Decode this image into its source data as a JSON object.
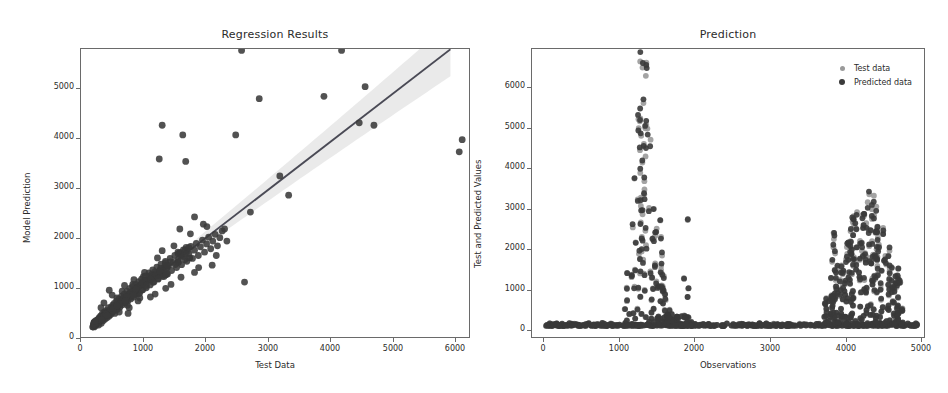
{
  "figure": {
    "width": 948,
    "height": 393,
    "background": "#ffffff"
  },
  "chart_data": [
    {
      "id": "regression-results",
      "type": "scatter",
      "title": "Regression Results",
      "xlabel": "Test Data",
      "ylabel": "Model Prediction",
      "xlim": [
        -180,
        6450
      ],
      "ylim": [
        -230,
        5780
      ],
      "xticks": [
        0,
        1000,
        2000,
        3000,
        4000,
        5000,
        6000
      ],
      "yticks": [
        0,
        1000,
        2000,
        3000,
        4000,
        5000
      ],
      "grid": false,
      "legend": null,
      "marker_color": "#3a3a3a",
      "line_color": "#4a4a55",
      "band_color": "#e3e3e3",
      "regression_line": {
        "slope": 0.94,
        "intercept": 40,
        "x_from": 0,
        "x_to": 6100
      },
      "confidence_band": {
        "half_width_at_x0": 45,
        "half_width_at_xmax": 560
      },
      "points": [
        [
          30,
          60
        ],
        [
          45,
          20
        ],
        [
          60,
          110
        ],
        [
          70,
          50
        ],
        [
          85,
          140
        ],
        [
          95,
          90
        ],
        [
          110,
          175
        ],
        [
          120,
          60
        ],
        [
          130,
          210
        ],
        [
          145,
          130
        ],
        [
          155,
          250
        ],
        [
          165,
          95
        ],
        [
          175,
          200
        ],
        [
          185,
          300
        ],
        [
          195,
          150
        ],
        [
          205,
          260
        ],
        [
          215,
          330
        ],
        [
          225,
          180
        ],
        [
          240,
          290
        ],
        [
          250,
          360
        ],
        [
          260,
          210
        ],
        [
          275,
          330
        ],
        [
          285,
          420
        ],
        [
          295,
          240
        ],
        [
          310,
          350
        ],
        [
          320,
          275
        ],
        [
          335,
          430
        ],
        [
          345,
          310
        ],
        [
          360,
          470
        ],
        [
          370,
          340
        ],
        [
          385,
          510
        ],
        [
          395,
          300
        ],
        [
          410,
          440
        ],
        [
          425,
          560
        ],
        [
          435,
          380
        ],
        [
          450,
          520
        ],
        [
          465,
          600
        ],
        [
          480,
          430
        ],
        [
          495,
          560
        ],
        [
          510,
          660
        ],
        [
          525,
          480
        ],
        [
          540,
          620
        ],
        [
          555,
          700
        ],
        [
          570,
          520
        ],
        [
          585,
          640
        ],
        [
          600,
          760
        ],
        [
          615,
          560
        ],
        [
          630,
          700
        ],
        [
          650,
          820
        ],
        [
          665,
          600
        ],
        [
          680,
          740
        ],
        [
          700,
          860
        ],
        [
          715,
          640
        ],
        [
          730,
          790
        ],
        [
          750,
          900
        ],
        [
          765,
          700
        ],
        [
          780,
          840
        ],
        [
          800,
          960
        ],
        [
          815,
          720
        ],
        [
          830,
          880
        ],
        [
          850,
          1010
        ],
        [
          870,
          790
        ],
        [
          890,
          940
        ],
        [
          910,
          1080
        ],
        [
          930,
          830
        ],
        [
          950,
          1000
        ],
        [
          975,
          1140
        ],
        [
          995,
          890
        ],
        [
          1015,
          1060
        ],
        [
          1040,
          1200
        ],
        [
          1060,
          950
        ],
        [
          1085,
          1120
        ],
        [
          1110,
          1260
        ],
        [
          1130,
          1010
        ],
        [
          1155,
          1180
        ],
        [
          1180,
          1320
        ],
        [
          1205,
          1070
        ],
        [
          1230,
          1240
        ],
        [
          1255,
          1380
        ],
        [
          1280,
          1130
        ],
        [
          1310,
          1300
        ],
        [
          1335,
          1440
        ],
        [
          1360,
          1190
        ],
        [
          1390,
          1360
        ],
        [
          1415,
          1500
        ],
        [
          1445,
          1250
        ],
        [
          1475,
          1420
        ],
        [
          1500,
          1560
        ],
        [
          1530,
          1310
        ],
        [
          1560,
          1480
        ],
        [
          1590,
          1620
        ],
        [
          1620,
          1380
        ],
        [
          1655,
          1540
        ],
        [
          1685,
          1690
        ],
        [
          1715,
          1440
        ],
        [
          1750,
          1610
        ],
        [
          1780,
          1750
        ],
        [
          1815,
          1500
        ],
        [
          1850,
          1680
        ],
        [
          1885,
          1820
        ],
        [
          1920,
          1570
        ],
        [
          1955,
          1740
        ],
        [
          1990,
          1880
        ],
        [
          2025,
          1640
        ],
        [
          2060,
          1800
        ],
        [
          2100,
          1940
        ],
        [
          2140,
          1700
        ],
        [
          2180,
          1870
        ],
        [
          2220,
          2010
        ],
        [
          430,
          620
        ],
        [
          520,
          760
        ],
        [
          610,
          470
        ],
        [
          700,
          900
        ],
        [
          790,
          560
        ],
        [
          880,
          1060
        ],
        [
          300,
          780
        ],
        [
          620,
          300
        ],
        [
          1080,
          700
        ],
        [
          1200,
          1600
        ],
        [
          1350,
          900
        ],
        [
          1500,
          2050
        ],
        [
          1750,
          1150
        ],
        [
          1900,
          2150
        ],
        [
          2050,
          1300
        ],
        [
          1150,
          3500
        ],
        [
          1200,
          4200
        ],
        [
          1550,
          4000
        ],
        [
          1600,
          3450
        ],
        [
          1750,
          2300
        ],
        [
          2450,
          4000
        ],
        [
          2550,
          5750
        ],
        [
          2600,
          950
        ],
        [
          2700,
          2400
        ],
        [
          2850,
          4750
        ],
        [
          3200,
          3150
        ],
        [
          3350,
          2750
        ],
        [
          3950,
          4800
        ],
        [
          4250,
          5750
        ],
        [
          4550,
          4250
        ],
        [
          4650,
          5000
        ],
        [
          4800,
          4200
        ],
        [
          6250,
          3650
        ],
        [
          6300,
          3900
        ],
        [
          160,
          420
        ],
        [
          210,
          520
        ],
        [
          350,
          680
        ],
        [
          470,
          330
        ],
        [
          560,
          880
        ],
        [
          640,
          420
        ],
        [
          720,
          1000
        ],
        [
          820,
          620
        ],
        [
          900,
          1150
        ],
        [
          1000,
          640
        ],
        [
          1120,
          1450
        ],
        [
          1260,
          820
        ],
        [
          1400,
          1700
        ],
        [
          1520,
          1050
        ],
        [
          1680,
          1950
        ],
        [
          1820,
          1250
        ],
        [
          1960,
          2100
        ],
        [
          2120,
          1500
        ],
        [
          2260,
          2050
        ],
        [
          2300,
          1800
        ]
      ]
    },
    {
      "id": "prediction",
      "type": "scatter",
      "title": "Prediction",
      "xlabel": "Observations",
      "ylabel": "Test and Predicted Values",
      "xlim": [
        -160,
        5060
      ],
      "ylim": [
        -320,
        6700
      ],
      "xticks": [
        0,
        1000,
        2000,
        3000,
        4000,
        5000
      ],
      "yticks": [
        0,
        1000,
        2000,
        3000,
        4000,
        5000,
        6000
      ],
      "grid": false,
      "legend": {
        "position": "upper right",
        "entries": [
          {
            "label": "Test data",
            "color": "#9a9a9a"
          },
          {
            "label": "Predicted data",
            "color": "#3a3a3a"
          }
        ]
      },
      "series": [
        {
          "name": "Test data",
          "color": "#9a9a9a",
          "note": "light gray markers, baseline near zero with two dense high-value clusters near x=1100-1900 and x=3700-4700"
        },
        {
          "name": "Predicted data",
          "color": "#3a3a3a",
          "note": "dark markers overlapping the test data at nearly the same observation indices"
        }
      ],
      "baseline_value": 20,
      "clusters": [
        {
          "x_from": 1050,
          "x_to": 1950,
          "peak": 6400
        },
        {
          "x_from": 3700,
          "x_to": 4750,
          "peak": 3150
        }
      ]
    }
  ]
}
